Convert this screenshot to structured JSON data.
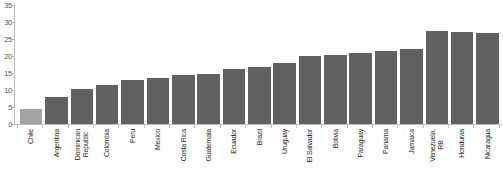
{
  "chart_data": {
    "type": "bar",
    "title": "",
    "xlabel": "",
    "ylabel": "",
    "ylim": [
      0,
      35
    ],
    "yticks": [
      0,
      5,
      10,
      15,
      20,
      25,
      30,
      35
    ],
    "grid": false,
    "legend_position": "none",
    "bar_color": "#616161",
    "highlight_bar_color": "#a3a3a3",
    "axis_color": "#bfbfbf",
    "tick_label_color": "#595959",
    "category_label_color": "#262626",
    "categories": [
      "Chile",
      "Argentina",
      "Dominican\nRepublic",
      "Colombia",
      "Peru",
      "Mexico",
      "Costa Rica",
      "Guatemala",
      "Ecuador",
      "Brazil",
      "Uruguay",
      "El Salvador",
      "Bolivia",
      "Paraguay",
      "Panama",
      "Jamaica",
      "Venezuela,\nRB",
      "Honduras",
      "Nicaragua"
    ],
    "values": [
      4.4,
      7.9,
      10.4,
      11.4,
      12.8,
      13.4,
      14.3,
      14.7,
      16.3,
      16.9,
      17.8,
      20.0,
      20.2,
      20.8,
      21.4,
      22.2,
      27.4,
      27.0,
      26.7
    ],
    "highlighted_category": "Chile"
  }
}
